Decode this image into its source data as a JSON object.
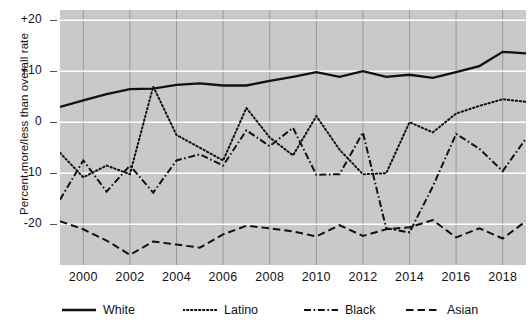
{
  "chart_data": {
    "type": "line",
    "title": "",
    "xlabel": "",
    "ylabel": "Percent more/less than overall rate",
    "xlim": [
      1999,
      2019
    ],
    "ylim": [
      -28,
      22
    ],
    "grid": true,
    "legend_position": "bottom",
    "y_ticks": [
      "+20",
      "+10",
      "0",
      "-10",
      "-20"
    ],
    "y_tick_values": [
      20,
      10,
      0,
      -10,
      -20
    ],
    "x_ticks": [
      "2000",
      "2002",
      "2004",
      "2006",
      "2008",
      "2010",
      "2012",
      "2014",
      "2016",
      "2018"
    ],
    "x_tick_values": [
      2000,
      2002,
      2004,
      2006,
      2008,
      2010,
      2012,
      2014,
      2016,
      2018
    ],
    "x": [
      1999,
      2000,
      2001,
      2002,
      2003,
      2004,
      2005,
      2006,
      2007,
      2008,
      2009,
      2010,
      2011,
      2012,
      2013,
      2014,
      2015,
      2016,
      2017,
      2018,
      2019
    ],
    "series": [
      {
        "name": "White",
        "style": "solid",
        "color": "#111111",
        "values": [
          3.0,
          4.3,
          5.5,
          6.5,
          6.6,
          7.3,
          7.6,
          7.2,
          7.2,
          8.1,
          8.9,
          9.8,
          8.9,
          10.0,
          8.9,
          9.3,
          8.7,
          9.8,
          11.0,
          13.8,
          13.5
        ]
      },
      {
        "name": "Latino",
        "style": "dotted",
        "color": "#111111",
        "values": [
          -6.0,
          -10.8,
          -8.5,
          -10.2,
          7.0,
          -2.5,
          -5.0,
          -7.5,
          2.8,
          -3.0,
          -6.5,
          1.2,
          -5.4,
          -10.2,
          -10.0,
          0.0,
          -2.0,
          1.7,
          3.2,
          4.5,
          4.0
        ]
      },
      {
        "name": "Black",
        "style": "dashdot",
        "color": "#111111",
        "values": [
          -15.2,
          -7.5,
          -13.6,
          -8.5,
          -13.8,
          -7.5,
          -6.3,
          -8.5,
          -1.6,
          -4.7,
          -1.1,
          -10.3,
          -10.2,
          -2.0,
          -20.8,
          -21.6,
          -12.6,
          -2.3,
          -5.2,
          -9.6,
          -3.2
        ]
      },
      {
        "name": "Asian",
        "style": "dashed",
        "color": "#111111",
        "values": [
          -19.4,
          -21.0,
          -23.2,
          -26.0,
          -23.4,
          -24.0,
          -24.6,
          -22.0,
          -20.3,
          -20.8,
          -21.4,
          -22.4,
          -20.2,
          -22.3,
          -21.0,
          -20.6,
          -19.2,
          -22.6,
          -20.8,
          -22.8,
          -19.4
        ]
      }
    ]
  },
  "legend": {
    "items": [
      {
        "label": "White",
        "style": "solid"
      },
      {
        "label": "Latino",
        "style": "dotted"
      },
      {
        "label": "Black",
        "style": "dashdot"
      },
      {
        "label": "Asian",
        "style": "dashed"
      }
    ]
  }
}
